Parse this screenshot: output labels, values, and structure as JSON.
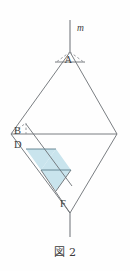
{
  "figure": {
    "caption": "図 2",
    "line_label_m": "m",
    "vertex_labels": {
      "apex_top": "A",
      "left_upper": "B",
      "left_lower": "D",
      "bottom_right": "F"
    },
    "colors": {
      "stroke": "#6b6f74",
      "stroke_dark": "#55585c",
      "shade_fill": "#c9e4ed",
      "shade_stroke": "#5f7f8c",
      "background": "#fefefe",
      "text": "#3d3d3d"
    },
    "geometry": {
      "rhombus": {
        "top": [
          70,
          52
        ],
        "left": [
          11,
          134
        ],
        "right": [
          117,
          134
        ],
        "bottom": [
          70,
          213
        ]
      },
      "axis_line_m": {
        "x": 70,
        "y_top": 20,
        "y_bottom": 52
      },
      "axis_line_bottom": {
        "x": 70,
        "y_top": 213,
        "y_bottom": 237
      },
      "mid_horizontal": {
        "y": 134,
        "x_left": 11,
        "x_right": 117
      },
      "upper_small_chord": {
        "y": 62,
        "x_left": 55,
        "x_right": 85
      },
      "dashed_triangle_A": [
        [
          70,
          52
        ],
        [
          55,
          62
        ],
        [
          85,
          62
        ]
      ],
      "dashed_triangle_B": [
        [
          11,
          134
        ],
        [
          26,
          124
        ],
        [
          26,
          134
        ]
      ],
      "shaded_triangles": [
        [
          [
            26,
            149
          ],
          [
            56,
            149
          ],
          [
            41,
            170
          ]
        ],
        [
          [
            41,
            170
          ],
          [
            71,
            170
          ],
          [
            56,
            149
          ]
        ],
        [
          [
            41,
            170
          ],
          [
            71,
            170
          ],
          [
            56,
            191
          ]
        ]
      ],
      "guide_lines": [
        {
          "from": [
            26,
            149
          ],
          "to": [
            56,
            149
          ]
        },
        {
          "from": [
            41,
            170
          ],
          "to": [
            71,
            170
          ]
        },
        {
          "from": [
            26,
            124
          ],
          "to": [
            70,
            195
          ]
        },
        {
          "from": [
            11,
            134
          ],
          "to": [
            70,
            213
          ]
        },
        {
          "from": [
            70,
            52
          ],
          "to": [
            11,
            134
          ]
        },
        {
          "from": [
            70,
            52
          ],
          "to": [
            117,
            134
          ]
        },
        {
          "from": [
            117,
            134
          ],
          "to": [
            70,
            213
          ]
        }
      ]
    },
    "label_positions": {
      "m": [
        77,
        30
      ],
      "A": [
        65,
        66
      ],
      "B": [
        15,
        129
      ],
      "D": [
        15,
        146
      ],
      "F": [
        61,
        203
      ]
    }
  }
}
